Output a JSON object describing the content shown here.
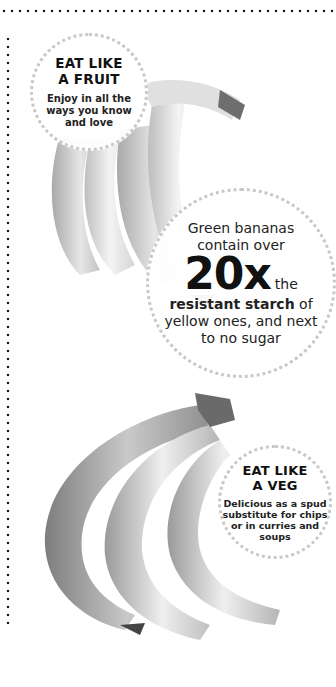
{
  "decor": {
    "border_color": "#111111",
    "ring_color": "#c8c8c8"
  },
  "images": {
    "top_bananas": "banana-bunch-photo-grayscale",
    "bottom_bananas": "banana-bunch-photo-grayscale"
  },
  "callouts": {
    "fruit": {
      "heading_line1": "EAT LIKE",
      "heading_line2": "A FRUIT",
      "body_line1": "Enjoy in all the",
      "body_line2": "ways you know",
      "body_line3": "and love"
    },
    "starch": {
      "line1": "Green bananas",
      "line2": "contain over",
      "big_number": "20x",
      "after_number": "the",
      "line3_bold": "resistant starch",
      "line3_rest": " of",
      "line4": "yellow ones, and next",
      "line5": "to no sugar"
    },
    "veg": {
      "heading_line1": "EAT LIKE",
      "heading_line2": "A VEG",
      "body_line1": "Delicious as a spud",
      "body_line2": "substitute for chips",
      "body_line3": "or in curries and",
      "body_line4": "soups"
    }
  }
}
